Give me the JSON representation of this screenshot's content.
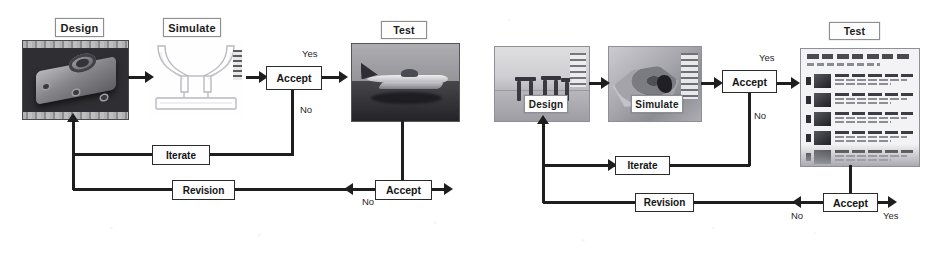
{
  "figure": {
    "caption": "Two side-by-side iterative Design-Simulate-Test process flow diagrams",
    "background_color": "#ffffff",
    "line_color": "#1e1e1e",
    "box_fill": "#fdfdfd"
  },
  "diagrams": [
    {
      "id": "left",
      "name": "mechanical-part-workflow",
      "stage_labels": {
        "design": "Design",
        "simulate": "Simulate",
        "test": "Test"
      },
      "decisions": {
        "accept_top": "Accept",
        "accept_bottom": "Accept"
      },
      "feedback_boxes": {
        "iterate": "Iterate",
        "revision": "Revision"
      },
      "edge_labels": {
        "accept_top_yes": "Yes",
        "accept_top_no": "No",
        "accept_bottom_no": "No"
      },
      "images": {
        "design": "cad-bracket-render",
        "simulate": "fea-mesh-outline",
        "test": "aircraft-photo"
      }
    },
    {
      "id": "right",
      "name": "geospatial-workflow",
      "stage_labels": {
        "design": "Design",
        "simulate": "Simulate",
        "test": "Test"
      },
      "decisions": {
        "accept_top": "Accept",
        "accept_bottom": "Accept"
      },
      "feedback_boxes": {
        "iterate": "Iterate",
        "revision": "Revision"
      },
      "edge_labels": {
        "accept_top_yes": "Yes",
        "accept_top_no": "No",
        "accept_bottom_no": "No",
        "accept_bottom_yes": "Yes"
      },
      "images": {
        "design": "stone-structure-photo",
        "simulate": "terrain-simulation-plot",
        "test": "web-results-page"
      }
    }
  ]
}
